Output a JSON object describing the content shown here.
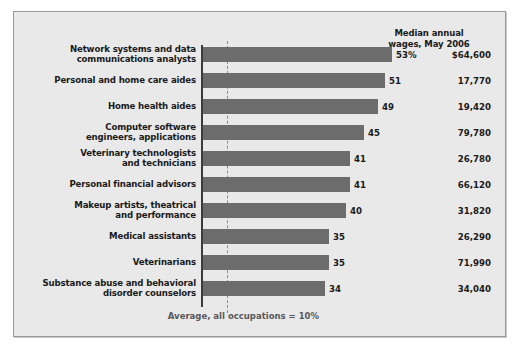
{
  "chart_data": {
    "type": "bar",
    "orientation": "horizontal",
    "title": "",
    "xlabel": "",
    "ylabel": "",
    "xlim": [
      0,
      60
    ],
    "grid": false,
    "legend": null,
    "value_suffix_first": "%",
    "categories": [
      "Network systems and data communications analysts",
      "Personal and home care aides",
      "Home health aides",
      "Computer software engineers, applications",
      "Veterinary technologists and technicians",
      "Personal financial advisors",
      "Makeup artists, theatrical and performance",
      "Medical assistants",
      "Veterinarians",
      "Substance abuse and behavioral disorder counselors"
    ],
    "values": [
      53,
      51,
      49,
      45,
      41,
      41,
      40,
      35,
      35,
      34
    ],
    "value_labels": [
      "53%",
      "51",
      "49",
      "45",
      "41",
      "41",
      "40",
      "35",
      "35",
      "34"
    ],
    "series": [
      {
        "name": "Percent change in employment, projected 2006-16",
        "values": [
          53,
          51,
          49,
          45,
          41,
          41,
          40,
          35,
          35,
          34
        ]
      }
    ],
    "reference_line": {
      "label": "Average, all occupations = 10%",
      "value": 10,
      "style": "dashed"
    },
    "annotations": {
      "wage_column_header": "Median annual\nwages, May 2006",
      "wage_values": [
        "$64,600",
        "17,770",
        "19,420",
        "79,780",
        "26,780",
        "66,120",
        "31,820",
        "26,290",
        "71,990",
        "34,040"
      ]
    },
    "colors": {
      "bar": "#6c6c6c",
      "panel_background": "#e9e9e9",
      "axis": "#3b3b3b",
      "reference_line": "#8d8d8d",
      "text": "#1a1a1a",
      "note_text": "#585858"
    }
  },
  "header": {
    "wages_line1": "Median annual",
    "wages_line2": "wages, May 2006"
  },
  "rows": [
    {
      "label_line1": "Network systems and data",
      "label_line2": "communications analysts",
      "value": "53%",
      "wage": "$64,600",
      "bar_px": 189
    },
    {
      "label_line1": "Personal and home care aides",
      "label_line2": "",
      "value": "51",
      "wage": "17,770",
      "bar_px": 182
    },
    {
      "label_line1": "Home health aides",
      "label_line2": "",
      "value": "49",
      "wage": "19,420",
      "bar_px": 175
    },
    {
      "label_line1": "Computer software",
      "label_line2": "engineers, applications",
      "value": "45",
      "wage": "79,780",
      "bar_px": 161
    },
    {
      "label_line1": "Veterinary technologists",
      "label_line2": "and technicians",
      "value": "41",
      "wage": "26,780",
      "bar_px": 147
    },
    {
      "label_line1": "Personal financial advisors",
      "label_line2": "",
      "value": "41",
      "wage": "66,120",
      "bar_px": 147
    },
    {
      "label_line1": "Makeup artists, theatrical",
      "label_line2": "and performance",
      "value": "40",
      "wage": "31,820",
      "bar_px": 143
    },
    {
      "label_line1": "Medical assistants",
      "label_line2": "",
      "value": "35",
      "wage": "26,290",
      "bar_px": 126
    },
    {
      "label_line1": "Veterinarians",
      "label_line2": "",
      "value": "35",
      "wage": "71,990",
      "bar_px": 126
    },
    {
      "label_line1": "Substance abuse and behavioral",
      "label_line2": "disorder counselors",
      "value": "34",
      "wage": "34,040",
      "bar_px": 122
    }
  ],
  "reference": {
    "note": "Average, all occupations = 10%"
  }
}
